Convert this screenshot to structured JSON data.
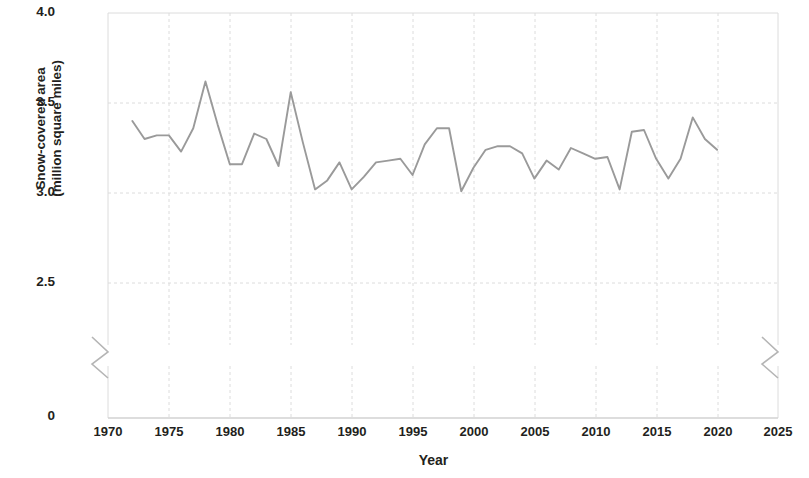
{
  "chart_data": {
    "type": "line",
    "title": "",
    "subtitle": "",
    "xlabel": "Year",
    "ylabel": "Snow-covered area (million square miles)",
    "ylabel_line1": "Snow-covered area",
    "ylabel_line2": "(million square miles)",
    "xlim": [
      1970,
      2025
    ],
    "ylim": [
      0,
      4.0
    ],
    "y_axis_break": true,
    "y_break_between": [
      0,
      2.5
    ],
    "grid": true,
    "legend": null,
    "line_color": "#9a9a9a",
    "text_color": "#231f20",
    "grid_color": "#dcdcdc",
    "xticks": [
      1970,
      1975,
      1980,
      1985,
      1990,
      1995,
      2000,
      2005,
      2010,
      2015,
      2020,
      2025
    ],
    "xtick_labels": [
      "1970",
      "1975",
      "1980",
      "1985",
      "1990",
      "1995",
      "2000",
      "2005",
      "2010",
      "2015",
      "2020",
      "2025"
    ],
    "yticks": [
      0,
      2.5,
      3.0,
      3.5,
      4.0
    ],
    "ytick_labels": [
      "0",
      "2.5",
      "3.0",
      "3.5",
      "4.0"
    ],
    "series": [
      {
        "name": "Snow-covered area",
        "x": [
          1972,
          1973,
          1974,
          1975,
          1976,
          1977,
          1978,
          1979,
          1980,
          1981,
          1982,
          1983,
          1984,
          1985,
          1986,
          1987,
          1988,
          1989,
          1990,
          1991,
          1992,
          1993,
          1994,
          1995,
          1996,
          1997,
          1998,
          1999,
          2000,
          2001,
          2002,
          2003,
          2004,
          2005,
          2006,
          2007,
          2008,
          2009,
          2010,
          2011,
          2012,
          2013,
          2014,
          2015,
          2016,
          2017,
          2018,
          2019,
          2020
        ],
        "values": [
          3.4,
          3.3,
          3.32,
          3.32,
          3.23,
          3.36,
          3.62,
          3.38,
          3.16,
          3.16,
          3.33,
          3.3,
          3.15,
          3.56,
          3.28,
          3.02,
          3.07,
          3.17,
          3.02,
          3.09,
          3.17,
          3.18,
          3.19,
          3.1,
          3.27,
          3.36,
          3.36,
          3.01,
          3.14,
          3.24,
          3.26,
          3.26,
          3.22,
          3.08,
          3.18,
          3.13,
          3.25,
          3.22,
          3.19,
          3.2,
          3.02,
          3.34,
          3.35,
          3.19,
          3.08,
          3.19,
          3.42,
          3.3,
          3.24
        ]
      }
    ]
  },
  "axis": {
    "ylabel_line1": "Snow-covered area",
    "ylabel_line2": "(million square miles)",
    "xlabel": "Year"
  },
  "ytick_labels": [
    "4.0",
    "3.5",
    "3.0",
    "2.5",
    "0"
  ],
  "xtick_labels": [
    "1970",
    "1975",
    "1980",
    "1985",
    "1990",
    "1995",
    "2000",
    "2005",
    "2010",
    "2015",
    "2020",
    "2025"
  ]
}
